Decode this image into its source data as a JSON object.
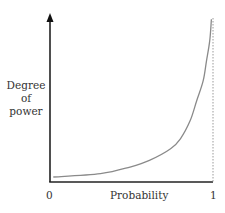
{
  "chart_data": {
    "type": "line",
    "title": "",
    "xlabel": "Probability",
    "ylabel": "Degree of power",
    "ylabel_lines": [
      "Degree",
      "of",
      "power"
    ],
    "x_ticks": [
      "0",
      "1"
    ],
    "xlim": [
      0,
      1
    ],
    "y_ticks": [],
    "grid": false,
    "legend": null,
    "asymptote": {
      "x": 1,
      "style": "dashed"
    },
    "series": [
      {
        "name": "Degree of power vs probability",
        "color": "#8a8a8a",
        "x": [
          0.02,
          0.31,
          0.49,
          0.61,
          0.74,
          0.8,
          0.86,
          0.9,
          0.94,
          0.96,
          0.98,
          0.99
        ],
        "y": [
          0.03,
          0.05,
          0.09,
          0.13,
          0.2,
          0.26,
          0.37,
          0.49,
          0.61,
          0.73,
          0.85,
          0.98
        ]
      }
    ],
    "annotations": []
  },
  "labels": {
    "ylabel_line1": "Degree",
    "ylabel_line2": "of",
    "ylabel_line3": "power",
    "x_tick_0": "0",
    "x_tick_1": "1",
    "xlabel": "Probability"
  },
  "colors": {
    "axis": "#222222",
    "curve": "#8a8a8a",
    "asymptote": "#9a9a9a"
  }
}
